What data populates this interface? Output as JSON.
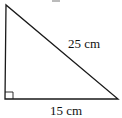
{
  "figure": {
    "type": "right-triangle",
    "labels": {
      "hypotenuse": "25 cm",
      "base": "15 cm"
    },
    "right_angle_marker": true,
    "stroke_color": "#1a1a1a"
  }
}
